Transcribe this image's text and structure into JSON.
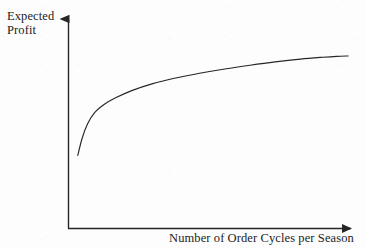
{
  "figure": {
    "background_color": "#fdfdfd",
    "ink_color": "#262626"
  },
  "y_axis_label": {
    "line1": "Expected",
    "line2": "Profit"
  },
  "x_axis_label": {
    "text": "Number of Order Cycles per Season"
  },
  "chart_data": {
    "type": "line",
    "title": "",
    "subtitle": "",
    "xlabel": "Number of Order Cycles per Season",
    "ylabel": "Expected Profit",
    "grid": false,
    "legend": null,
    "legend_position": "none",
    "axis_style": "arrow-headed open axes, no tick marks, no tick labels",
    "xlim": [
      0,
      1
    ],
    "ylim": [
      0,
      1
    ],
    "xticks": [],
    "yticks": [],
    "xticklabels": [],
    "yticklabels": [],
    "annotations": [],
    "series": [
      {
        "name": "Expected Profit curve",
        "shape": "concave increasing (diminishing returns, logarithmic)",
        "x": [
          0.035,
          0.05,
          0.07,
          0.095,
          0.13,
          0.17,
          0.23,
          0.3,
          0.38,
          0.47,
          0.56,
          0.65,
          0.74,
          0.83,
          0.91,
          0.96,
          1.0
        ],
        "y": [
          0.39,
          0.48,
          0.56,
          0.62,
          0.665,
          0.7,
          0.74,
          0.775,
          0.805,
          0.832,
          0.855,
          0.875,
          0.893,
          0.908,
          0.918,
          0.923,
          0.925
        ]
      }
    ]
  }
}
